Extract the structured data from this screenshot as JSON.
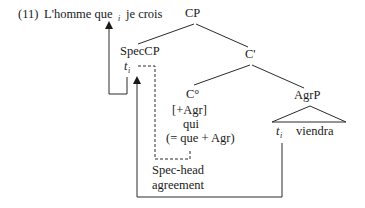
{
  "example": {
    "number": "(11)",
    "sentence_pre": "L'homme que",
    "index": "i",
    "sentence_post": "je crois"
  },
  "tree": {
    "root": "CP",
    "spec": "SpecCP",
    "cbar": "C'",
    "chead": "C°",
    "chead_features": [
      "[+Agr]",
      "qui",
      "(= que + Agr)"
    ],
    "agrp": "AgrP",
    "agrp_trace": "t",
    "agrp_trace_index": "i",
    "agrp_verb": "viendra",
    "spec_trace": "t",
    "spec_trace_index": "i"
  },
  "annotation": {
    "line1": "Spec-head",
    "line2": "agreement"
  }
}
